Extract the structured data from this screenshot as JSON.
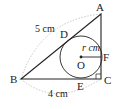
{
  "diagram": {
    "type": "geometry",
    "colors": {
      "line": "#222222",
      "arc": "#bbbbbb",
      "background": "#ffffff"
    },
    "points": {
      "A": {
        "label": "A",
        "x": 101,
        "y": 14
      },
      "B": {
        "label": "B",
        "x": 21,
        "y": 79
      },
      "C": {
        "label": "C",
        "x": 101,
        "y": 79
      },
      "D": {
        "label": "D",
        "x": 68,
        "y": 37
      },
      "E": {
        "label": "E",
        "x": 81,
        "y": 79
      },
      "F": {
        "label": "F",
        "x": 101,
        "y": 57
      },
      "O": {
        "label": "O",
        "x": 81,
        "y": 57
      }
    },
    "circle": {
      "center": "O",
      "radius_px": 21
    },
    "measurements": {
      "AB": "5 cm",
      "BC": "4 cm",
      "radius": "r cm"
    },
    "right_angle_at": "C"
  }
}
